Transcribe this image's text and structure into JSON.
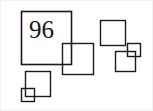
{
  "figure": {
    "title": "96",
    "type": "nested-squares-diagram",
    "background_color": "#ffffff",
    "stroke_color": "#1a1a1a",
    "label_color": "#151515",
    "canvas": {
      "width": 153,
      "height": 111
    },
    "label": {
      "text": "96",
      "font_size_px": 25,
      "x": 29,
      "y": 17,
      "inside_shape": "square-main"
    },
    "shapes": [
      {
        "id": "square-main",
        "name": "main-square",
        "shape": "square",
        "x": 21,
        "y": 11,
        "width": 50,
        "height": 53,
        "stroke_width": 1.6,
        "fill": "none",
        "contains_label": "96"
      },
      {
        "id": "square-overlap-center",
        "name": "center-overlap-square",
        "shape": "square",
        "x": 62,
        "y": 43,
        "width": 31,
        "height": 31,
        "stroke_width": 1.4,
        "fill": "none",
        "contains_label": ""
      },
      {
        "id": "square-lower-left-medium",
        "name": "lower-left-medium-square",
        "shape": "square",
        "x": 25,
        "y": 71,
        "width": 25,
        "height": 25,
        "stroke_width": 1.4,
        "fill": "none",
        "contains_label": ""
      },
      {
        "id": "square-lower-left-small",
        "name": "lower-left-small-square",
        "shape": "square",
        "x": 21,
        "y": 88,
        "width": 13,
        "height": 13,
        "stroke_width": 1.4,
        "fill": "none",
        "contains_label": ""
      },
      {
        "id": "square-upper-right",
        "name": "upper-right-square",
        "shape": "square",
        "x": 100,
        "y": 20,
        "width": 25,
        "height": 25,
        "stroke_width": 1.4,
        "fill": "none",
        "contains_label": ""
      },
      {
        "id": "square-right-small",
        "name": "right-small-square",
        "shape": "square",
        "x": 127,
        "y": 43,
        "width": 13,
        "height": 13,
        "stroke_width": 1.4,
        "fill": "none",
        "contains_label": ""
      },
      {
        "id": "square-right-medium",
        "name": "right-medium-square",
        "shape": "square",
        "x": 115,
        "y": 51,
        "width": 20,
        "height": 20,
        "stroke_width": 1.4,
        "fill": "none",
        "contains_label": ""
      }
    ]
  }
}
